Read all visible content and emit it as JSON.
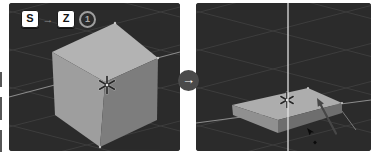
{
  "shortcut": {
    "scale_key": "S",
    "sequence_arrow": "→",
    "axis_key": "Z",
    "step_number": "1"
  },
  "transition": {
    "arrow": "→"
  },
  "icons": [
    "key-sequence-arrow-icon",
    "step-1-badge",
    "panel-transition-arrow-icon",
    "pivot-star-icon",
    "drag-direction-arrow-icon",
    "mouse-cursor-icon"
  ],
  "colors": {
    "canvas_bg": "#ffffff",
    "viewport_bg": "#2b2b2b",
    "grid_line": "#3d3d3d",
    "floor_axis_line": "#8c8c8c",
    "z_axis_line": "#e4e4e4",
    "cube_top": "#b3b3b3",
    "cube_left": "#9e9e9e",
    "cube_front": "#7d7d7d",
    "slab_top": "#adadad",
    "slab_left": "#909090",
    "slab_front": "#6e6e6e",
    "corner_highlight": "#d8d8d8",
    "key_bg": "#ffffff",
    "key_text": "#111111",
    "key_sequence_arrow": "#8f8f8f",
    "step_badge": "#9e9e9e",
    "pivot_star": "#262626",
    "pivot_star_halo": "#c9c9c9",
    "drag_arrow": "#474747",
    "cursor": "#0a0a0a",
    "transition_circle_bg": "#4a4a4a",
    "transition_arrow": "#ffffff",
    "edge_artifact": "#565656"
  }
}
